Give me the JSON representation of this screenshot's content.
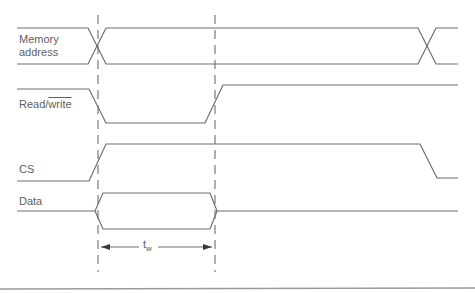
{
  "diagram": {
    "signals": [
      {
        "name": "memory-address",
        "label_line1": "Memory",
        "label_line2": "address",
        "type": "bus"
      },
      {
        "name": "read-write",
        "label_prefix": "Read/",
        "label_overlined": "write",
        "type": "line"
      },
      {
        "name": "cs",
        "label": "CS",
        "type": "line"
      },
      {
        "name": "data",
        "label": "Data",
        "type": "bus"
      }
    ],
    "timing": {
      "label_main": "t",
      "label_sub": "w",
      "marker_left_x": 98,
      "marker_right_x": 215
    },
    "colors": {
      "stroke": "#6e6e6e",
      "text": "#606060",
      "rule": "#9a9a9a"
    }
  }
}
